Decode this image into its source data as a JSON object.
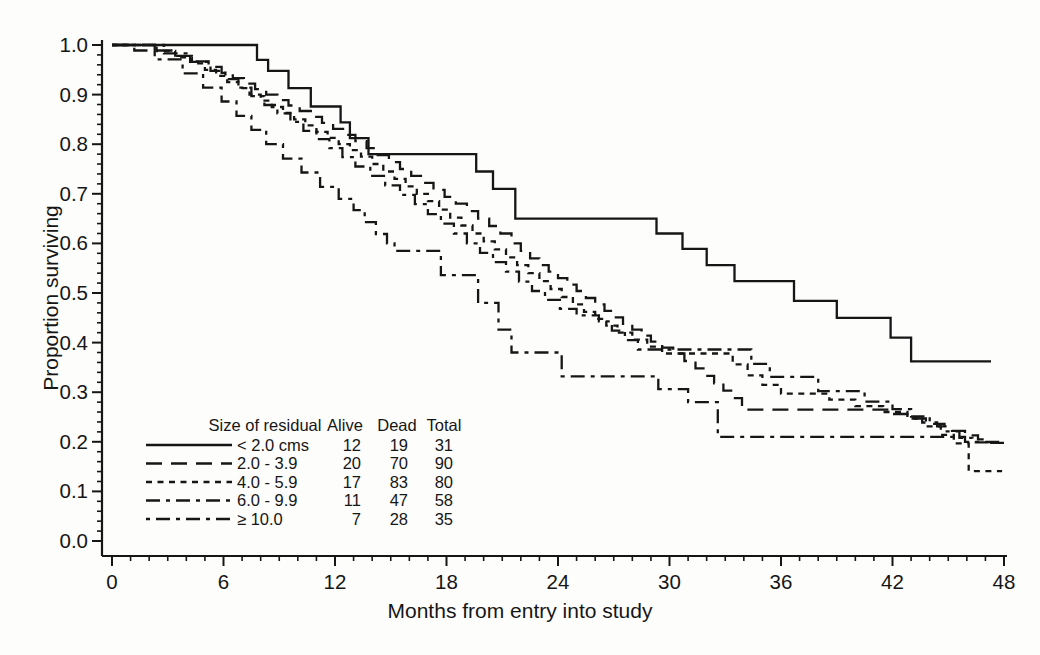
{
  "figure": {
    "background": "#fdfdfc",
    "ink": "#161616"
  },
  "chart_data": {
    "type": "line",
    "subtype": "kaplan-meier-step",
    "title": "",
    "xlabel": "Months from entry into study",
    "ylabel": "Proportion surviving",
    "xlim": [
      0,
      48
    ],
    "ylim": [
      0.0,
      1.0
    ],
    "grid": false,
    "x_major_ticks": [
      0,
      6,
      12,
      18,
      24,
      30,
      36,
      42,
      48
    ],
    "x_minor_step": 1,
    "y_major_ticks": [
      0.0,
      0.1,
      0.2,
      0.3,
      0.4,
      0.5,
      0.6,
      0.7,
      0.8,
      0.9,
      1.0
    ],
    "y_minor_step": 0.02,
    "legend": {
      "position": "lower-left-inside",
      "header": [
        "Size of residual",
        "Alive",
        "Dead",
        "Total"
      ],
      "rows": [
        {
          "label": "< 2.0 cms",
          "alive": "12",
          "dead": "19",
          "total": "31",
          "dash": "solid"
        },
        {
          "label": "2.0 - 3.9",
          "alive": "20",
          "dead": "70",
          "total": "90",
          "dash": "long-dash"
        },
        {
          "label": "4.0 - 5.9",
          "alive": "17",
          "dead": "83",
          "total": "80",
          "dash": "short-dash"
        },
        {
          "label": "6.0 - 9.9",
          "alive": "11",
          "dead": "47",
          "total": "58",
          "dash": "dash-dot-long-short"
        },
        {
          "label": "≥ 10.0",
          "alive": "7",
          "dead": "28",
          "total": "35",
          "dash": "dash-dot-short-long"
        }
      ]
    },
    "series": [
      {
        "name": "< 2.0 cms",
        "dash": "solid",
        "points": [
          [
            0,
            1.0
          ],
          [
            7.8,
            0.97
          ],
          [
            8.4,
            0.948
          ],
          [
            9.5,
            0.913
          ],
          [
            10.7,
            0.876
          ],
          [
            12.3,
            0.844
          ],
          [
            12.8,
            0.812
          ],
          [
            13.8,
            0.78
          ],
          [
            19.6,
            0.745
          ],
          [
            20.5,
            0.71
          ],
          [
            21.7,
            0.65
          ],
          [
            29.3,
            0.62
          ],
          [
            30.7,
            0.589
          ],
          [
            32,
            0.556
          ],
          [
            33.5,
            0.524
          ],
          [
            36.7,
            0.484
          ],
          [
            39,
            0.45
          ],
          [
            41.9,
            0.41
          ],
          [
            43,
            0.362
          ],
          [
            47.3,
            0.362
          ]
        ]
      },
      {
        "name": "2.0 - 3.9",
        "dash": "long-dash",
        "points": [
          [
            0,
            1.0
          ],
          [
            1.2,
            0.989
          ],
          [
            3.3,
            0.978
          ],
          [
            4.3,
            0.967
          ],
          [
            5.2,
            0.956
          ],
          [
            5.9,
            0.944
          ],
          [
            6.5,
            0.933
          ],
          [
            7.1,
            0.922
          ],
          [
            7.7,
            0.911
          ],
          [
            8.3,
            0.9
          ],
          [
            8.9,
            0.889
          ],
          [
            9.5,
            0.878
          ],
          [
            10.1,
            0.867
          ],
          [
            10.7,
            0.855
          ],
          [
            11.3,
            0.843
          ],
          [
            11.9,
            0.831
          ],
          [
            12.5,
            0.819
          ],
          [
            13.1,
            0.806
          ],
          [
            13.7,
            0.792
          ],
          [
            14.3,
            0.778
          ],
          [
            14.9,
            0.764
          ],
          [
            15.5,
            0.75
          ],
          [
            16.1,
            0.736
          ],
          [
            16.7,
            0.722
          ],
          [
            17.3,
            0.708
          ],
          [
            17.9,
            0.694
          ],
          [
            18.5,
            0.68
          ],
          [
            19.1,
            0.665
          ],
          [
            19.7,
            0.65
          ],
          [
            20.3,
            0.635
          ],
          [
            20.9,
            0.62
          ],
          [
            21.5,
            0.6
          ],
          [
            22,
            0.585
          ],
          [
            22.5,
            0.57
          ],
          [
            23,
            0.556
          ],
          [
            23.5,
            0.543
          ],
          [
            24,
            0.53
          ],
          [
            24.5,
            0.517
          ],
          [
            25,
            0.504
          ],
          [
            25.5,
            0.49
          ],
          [
            26,
            0.477
          ],
          [
            26.5,
            0.464
          ],
          [
            27,
            0.451
          ],
          [
            27.5,
            0.438
          ],
          [
            28,
            0.426
          ],
          [
            28.5,
            0.414
          ],
          [
            29,
            0.402
          ],
          [
            29.6,
            0.39
          ],
          [
            30.2,
            0.378
          ],
          [
            30.8,
            0.363
          ],
          [
            31.4,
            0.348
          ],
          [
            31.9,
            0.333
          ],
          [
            32.4,
            0.318
          ],
          [
            32.9,
            0.303
          ],
          [
            33.4,
            0.288
          ],
          [
            33.9,
            0.265
          ],
          [
            41.8,
            0.256
          ],
          [
            42.8,
            0.247
          ],
          [
            43.6,
            0.239
          ],
          [
            44.4,
            0.231
          ],
          [
            45.2,
            0.222
          ],
          [
            45.9,
            0.213
          ],
          [
            46.6,
            0.205
          ],
          [
            47.3,
            0.198
          ],
          [
            48,
            0.198
          ]
        ]
      },
      {
        "name": "4.0 - 5.9",
        "dash": "short-dash",
        "points": [
          [
            0,
            1.0
          ],
          [
            2.4,
            0.988
          ],
          [
            3.4,
            0.975
          ],
          [
            4.3,
            0.963
          ],
          [
            5,
            0.95
          ],
          [
            5.6,
            0.938
          ],
          [
            6.2,
            0.925
          ],
          [
            6.8,
            0.913
          ],
          [
            7.4,
            0.9
          ],
          [
            8,
            0.888
          ],
          [
            8.6,
            0.875
          ],
          [
            9.2,
            0.863
          ],
          [
            9.8,
            0.85
          ],
          [
            10.4,
            0.838
          ],
          [
            11,
            0.825
          ],
          [
            11.6,
            0.813
          ],
          [
            12.2,
            0.8
          ],
          [
            12.8,
            0.788
          ],
          [
            13.4,
            0.775
          ],
          [
            14,
            0.76
          ],
          [
            14.6,
            0.745
          ],
          [
            15.2,
            0.73
          ],
          [
            15.8,
            0.715
          ],
          [
            16.4,
            0.7
          ],
          [
            17,
            0.685
          ],
          [
            17.6,
            0.668
          ],
          [
            18.2,
            0.652
          ],
          [
            18.8,
            0.636
          ],
          [
            19.4,
            0.62
          ],
          [
            20,
            0.604
          ],
          [
            20.6,
            0.588
          ],
          [
            21.2,
            0.572
          ],
          [
            21.8,
            0.556
          ],
          [
            22.4,
            0.54
          ],
          [
            23,
            0.524
          ],
          [
            23.6,
            0.508
          ],
          [
            24.2,
            0.492
          ],
          [
            24.8,
            0.477
          ],
          [
            25.4,
            0.462
          ],
          [
            26,
            0.448
          ],
          [
            26.6,
            0.434
          ],
          [
            27.2,
            0.42
          ],
          [
            28,
            0.406
          ],
          [
            28.8,
            0.392
          ],
          [
            29.6,
            0.378
          ],
          [
            33.4,
            0.356
          ],
          [
            34.2,
            0.334
          ],
          [
            35,
            0.315
          ],
          [
            36,
            0.297
          ],
          [
            38.6,
            0.285
          ],
          [
            40,
            0.272
          ],
          [
            41.5,
            0.26
          ],
          [
            42.8,
            0.247
          ],
          [
            43.8,
            0.231
          ],
          [
            44.6,
            0.214
          ],
          [
            45.3,
            0.197
          ],
          [
            46.1,
            0.141
          ],
          [
            47.9,
            0.141
          ]
        ]
      },
      {
        "name": "6.0 - 9.9",
        "dash": "dash-dot-long-short",
        "points": [
          [
            0,
            1.0
          ],
          [
            2.8,
            0.983
          ],
          [
            4.2,
            0.966
          ],
          [
            5.3,
            0.948
          ],
          [
            6.1,
            0.931
          ],
          [
            6.8,
            0.914
          ],
          [
            7.5,
            0.897
          ],
          [
            8.2,
            0.879
          ],
          [
            8.9,
            0.862
          ],
          [
            9.6,
            0.845
          ],
          [
            10.3,
            0.827
          ],
          [
            11,
            0.81
          ],
          [
            11.7,
            0.792
          ],
          [
            12.4,
            0.774
          ],
          [
            13.1,
            0.755
          ],
          [
            13.9,
            0.736
          ],
          [
            14.7,
            0.717
          ],
          [
            15.5,
            0.698
          ],
          [
            16.3,
            0.679
          ],
          [
            17,
            0.659
          ],
          [
            17.7,
            0.64
          ],
          [
            18.4,
            0.62
          ],
          [
            19.1,
            0.6
          ],
          [
            19.8,
            0.581
          ],
          [
            20.5,
            0.562
          ],
          [
            21.2,
            0.543
          ],
          [
            21.9,
            0.523
          ],
          [
            22.6,
            0.504
          ],
          [
            23.3,
            0.486
          ],
          [
            24.1,
            0.468
          ],
          [
            25,
            0.455
          ],
          [
            26.2,
            0.443
          ],
          [
            26.9,
            0.424
          ],
          [
            27.6,
            0.405
          ],
          [
            28.3,
            0.386
          ],
          [
            34.4,
            0.357
          ],
          [
            35.4,
            0.331
          ],
          [
            38,
            0.302
          ],
          [
            40.5,
            0.281
          ],
          [
            42,
            0.266
          ],
          [
            43,
            0.251
          ],
          [
            44,
            0.236
          ],
          [
            44.8,
            0.221
          ],
          [
            45.6,
            0.208
          ],
          [
            46.3,
            0.199
          ],
          [
            48,
            0.199
          ]
        ]
      },
      {
        "name": "≥ 10.0",
        "dash": "dash-dot-short-long",
        "points": [
          [
            0,
            1.0
          ],
          [
            2.3,
            0.971
          ],
          [
            3.8,
            0.943
          ],
          [
            4.9,
            0.914
          ],
          [
            5.9,
            0.886
          ],
          [
            6.7,
            0.857
          ],
          [
            7.5,
            0.829
          ],
          [
            8.3,
            0.8
          ],
          [
            9.2,
            0.771
          ],
          [
            10.2,
            0.743
          ],
          [
            11.2,
            0.714
          ],
          [
            12.2,
            0.69
          ],
          [
            13,
            0.667
          ],
          [
            13.6,
            0.643
          ],
          [
            14.2,
            0.619
          ],
          [
            14.8,
            0.6
          ],
          [
            15.2,
            0.585
          ],
          [
            17.7,
            0.536
          ],
          [
            19.7,
            0.48
          ],
          [
            20.8,
            0.426
          ],
          [
            21.5,
            0.38
          ],
          [
            24.2,
            0.332
          ],
          [
            29.4,
            0.306
          ],
          [
            31,
            0.28
          ],
          [
            32.6,
            0.21
          ],
          [
            45.9,
            0.2
          ],
          [
            48,
            0.2
          ]
        ]
      }
    ]
  }
}
